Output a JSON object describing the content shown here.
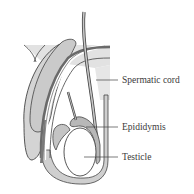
{
  "diagram": {
    "labels": [
      {
        "id": "spermatic-cord",
        "text": "Spermatic cord"
      },
      {
        "id": "epididymis",
        "text": "Epididymis"
      },
      {
        "id": "testicle",
        "text": "Testicle"
      }
    ],
    "colors": {
      "fill_light": "#d9d9d9",
      "fill_mid": "#c4c4c4",
      "fill_dark": "#8a8a8a",
      "stroke": "#444444",
      "white": "#ffffff"
    }
  }
}
